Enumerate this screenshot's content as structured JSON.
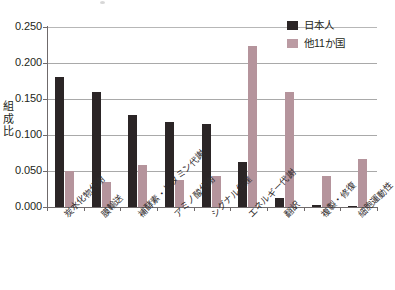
{
  "chart_data": {
    "type": "bar",
    "title": "",
    "xlabel": "",
    "ylabel": "組成比",
    "ylim": [
      0.0,
      0.25
    ],
    "ytick_labels": [
      "0.000",
      "0.050",
      "0.100",
      "0.150",
      "0.200",
      "0.250"
    ],
    "ytick_values": [
      0.0,
      0.05,
      0.1,
      0.15,
      0.2,
      0.25
    ],
    "grid": true,
    "legend_position": "top-right",
    "categories": [
      "炭水化物代謝",
      "膜輸送",
      "補酵素・ビタミン代謝",
      "アミノ酸代謝",
      "シグナル伝達",
      "エネルギー代謝",
      "翻訳",
      "複製・修復",
      "細胞運動性"
    ],
    "series": [
      {
        "name": "日本人",
        "color": "#2b2526",
        "values": [
          0.18,
          0.16,
          0.128,
          0.118,
          0.115,
          0.063,
          0.013,
          0.003,
          0.002
        ]
      },
      {
        "name": "他11か国",
        "color": "#b5949c",
        "values": [
          0.05,
          0.035,
          0.059,
          0.037,
          0.043,
          0.223,
          0.16,
          0.043,
          0.067
        ]
      }
    ]
  },
  "legend": {
    "items": [
      {
        "label": "日本人"
      },
      {
        "label": "他11か国"
      }
    ]
  }
}
